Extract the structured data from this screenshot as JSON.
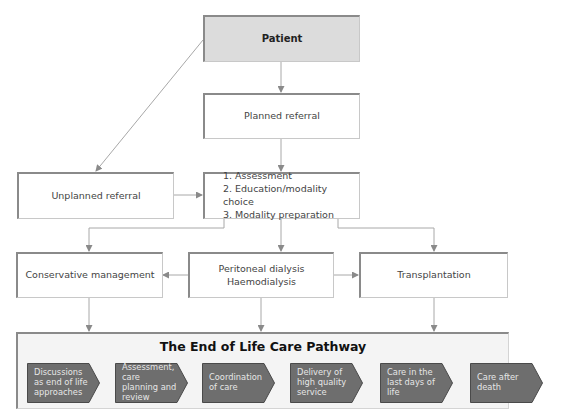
{
  "boxes": {
    "patient": "Patient",
    "planned_referral": "Planned referral",
    "unplanned_referral": "Unplanned referral",
    "assessment_steps": [
      "1. Assessment",
      "2. Education/modality choice",
      "3. Modality preparation"
    ],
    "conservative": "Conservative management",
    "dialysis": [
      "Peritoneal dialysis",
      "Haemodialysis"
    ],
    "transplantation": "Transplantation"
  },
  "pathway": {
    "title": "The End of Life Care Pathway",
    "steps": [
      "Discussions as end of life approaches",
      "Assessment, care planning and review",
      "Coordination of care",
      "Delivery of high quality service",
      "Care in the last days of life",
      "Care after death"
    ]
  },
  "colors": {
    "patient_fill": "#dcdcdc",
    "connector": "#9a9a9a",
    "chevron_fill": "#6e6e6e",
    "panel_fill": "#f4f4f4"
  }
}
